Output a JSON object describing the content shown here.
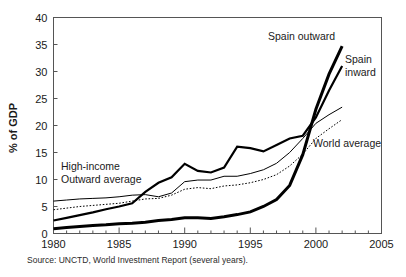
{
  "figure": {
    "source_note": "Source: UNCTD, World Investment Report (several years).",
    "background_color": "#ffffff",
    "frame_color": "#555555"
  },
  "chart_data": {
    "type": "line",
    "title": "",
    "xlabel": "",
    "ylabel": "% of GDP",
    "xlim": [
      1980,
      2005
    ],
    "ylim": [
      0,
      40
    ],
    "grid": false,
    "legend_position": "inline-annotations",
    "x_ticks_major": [
      1980,
      1985,
      1990,
      1995,
      2000,
      2005
    ],
    "x_tick_labels": [
      "1980",
      "1985",
      "1990",
      "1995",
      "2000",
      "2005"
    ],
    "x_minor_tick_step": 1,
    "y_ticks": [
      0,
      5,
      10,
      15,
      20,
      25,
      30,
      35,
      40
    ],
    "y_tick_labels": [
      "0",
      "5",
      "10",
      "15",
      "20",
      "25",
      "30",
      "35",
      "40"
    ],
    "x": [
      1980,
      1981,
      1982,
      1983,
      1984,
      1985,
      1986,
      1987,
      1988,
      1989,
      1990,
      1991,
      1992,
      1993,
      1994,
      1995,
      1996,
      1997,
      1998,
      1999,
      2000,
      2001,
      2002
    ],
    "series": [
      {
        "name": "Spain outward",
        "color": "#000000",
        "style": "solid",
        "width": 3.0,
        "values": [
          0.9,
          1.1,
          1.3,
          1.5,
          1.6,
          1.8,
          1.9,
          2.1,
          2.4,
          2.6,
          2.9,
          2.9,
          2.8,
          3.1,
          3.5,
          4.0,
          5.0,
          6.3,
          8.9,
          14.6,
          23.0,
          29.5,
          34.7
        ]
      },
      {
        "name": "Spain inward",
        "color": "#000000",
        "style": "solid",
        "width": 2.2,
        "values": [
          2.4,
          2.9,
          3.4,
          3.9,
          4.5,
          5.0,
          5.6,
          7.7,
          9.4,
          10.4,
          12.9,
          11.6,
          11.3,
          12.2,
          16.1,
          15.8,
          15.2,
          16.4,
          17.6,
          18.1,
          21.5,
          26.5,
          31.0
        ]
      },
      {
        "name": "High-income Outward average",
        "color": "#000000",
        "style": "solid",
        "width": 1.0,
        "values": [
          6.0,
          6.2,
          6.4,
          6.5,
          6.6,
          6.8,
          7.1,
          7.2,
          6.8,
          7.5,
          9.6,
          9.9,
          9.9,
          10.6,
          10.6,
          11.1,
          11.8,
          13.0,
          15.0,
          17.6,
          20.4,
          22.0,
          23.4
        ]
      },
      {
        "name": "World average",
        "color": "#000000",
        "style": "dotted",
        "width": 1.0,
        "values": [
          4.4,
          4.7,
          5.0,
          5.2,
          5.4,
          5.6,
          6.0,
          6.4,
          6.5,
          7.1,
          8.2,
          8.5,
          8.3,
          8.8,
          9.0,
          9.4,
          10.0,
          10.9,
          12.5,
          14.7,
          17.6,
          19.4,
          21.1
        ]
      }
    ],
    "annotations": [
      {
        "name": "spain-outward",
        "text": "Spain outward",
        "x_px": 268,
        "y_px": 40,
        "lines": [
          "Spain outward"
        ]
      },
      {
        "name": "spain-inward",
        "text": "Spain inward",
        "x_px": 345,
        "y_px": 63,
        "lines": [
          "Spain",
          "inward"
        ]
      },
      {
        "name": "world-average",
        "text": "World average",
        "x_px": 313,
        "y_px": 147,
        "lines": [
          "World average"
        ]
      },
      {
        "name": "high-income-outward-average",
        "text": "High-income Outward average",
        "x_px": 61,
        "y_px": 170,
        "lines": [
          "High-income",
          "Outward average"
        ]
      }
    ]
  }
}
